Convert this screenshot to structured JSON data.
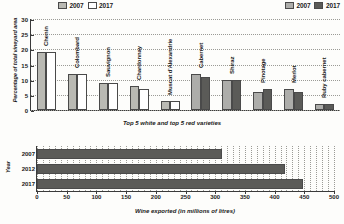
{
  "legends": {
    "white": {
      "items": [
        {
          "label": "2007",
          "swatch": "light-gray"
        },
        {
          "label": "2017",
          "swatch": "white"
        }
      ]
    },
    "red": {
      "items": [
        {
          "label": "2007",
          "swatch": "mid-gray"
        },
        {
          "label": "2017",
          "swatch": "dark-gray"
        }
      ]
    }
  },
  "colors": {
    "white_2007": "#b9b9b3",
    "white_2017": "#ffffff",
    "red_2007": "#adadaa",
    "red_2017": "#5b5b58",
    "axis": "#3a3a3a",
    "grid": "#9b9b96"
  },
  "chart_data": [
    {
      "type": "bar",
      "title": "",
      "xlabel": "Top 5 white and top 5 red varieties",
      "ylabel": "Percentage of total vineyard area",
      "ylim": [
        0,
        30
      ],
      "yticks": [
        0,
        5,
        10,
        15,
        20,
        25,
        30
      ],
      "grid": true,
      "legend_position": "top",
      "categories": [
        "Chenin",
        "Colombard",
        "Sauvignon",
        "Chardonnay",
        "Muscat d'Alexandrie",
        "Cabernet",
        "Shiraz",
        "Pinotage",
        "Merlot",
        "Ruby cabernet"
      ],
      "category_group": [
        "white",
        "white",
        "white",
        "white",
        "white",
        "red",
        "red",
        "red",
        "red",
        "red"
      ],
      "series": [
        {
          "name": "2007",
          "values": [
            19,
            12,
            9,
            8,
            3,
            12,
            10,
            6,
            7,
            2
          ]
        },
        {
          "name": "2017",
          "values": [
            19,
            12,
            9,
            7,
            3,
            11,
            10,
            7,
            6,
            2
          ]
        }
      ]
    },
    {
      "type": "bar",
      "orientation": "horizontal",
      "title": "",
      "xlabel": "Wine exported (in millions of litres)",
      "ylabel": "Year",
      "xlim": [
        0,
        500
      ],
      "xticks": [
        0,
        50,
        100,
        150,
        200,
        250,
        300,
        350,
        400,
        450,
        500
      ],
      "grid": true,
      "categories": [
        "2007",
        "2012",
        "2017"
      ],
      "values": [
        312,
        418,
        448
      ]
    }
  ]
}
